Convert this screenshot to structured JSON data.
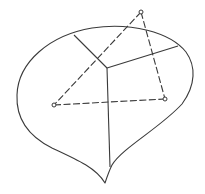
{
  "figure": {
    "stroke_color": "#3a3a3a",
    "background": "#ffffff",
    "vertices": [
      {
        "name": "top",
        "x": 141,
        "y": 12
      },
      {
        "name": "left",
        "x": 54,
        "y": 105
      },
      {
        "name": "right",
        "x": 165,
        "y": 99
      }
    ],
    "junction": {
      "x": 107,
      "y": 68
    },
    "cusp": {
      "x": 105,
      "y": 183
    }
  },
  "caption": {
    "text": "",
    "note": "caption text cut off at bottom edge"
  }
}
